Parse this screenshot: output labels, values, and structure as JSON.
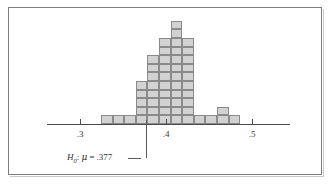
{
  "figure": {
    "border_color": "#7d7d7d",
    "background": "#ffffff"
  },
  "axis": {
    "tick_labels": [
      ".3",
      ".4",
      ".5"
    ],
    "tick_values": [
      0.3,
      0.4,
      0.5
    ],
    "line_color": "#4a4a4a"
  },
  "annotation": {
    "hypothesis_symbol": "H",
    "hypothesis_subscript": "0",
    "colon": ":",
    "mu_symbol": "μ",
    "equals": "=",
    "value": ".377",
    "full_text": "H0: μ = .377",
    "pointer_x_value": 0.377
  },
  "chart_data": {
    "type": "bar",
    "title": "",
    "subtitle": "",
    "xlabel": "",
    "ylabel": "",
    "grid": false,
    "legend": null,
    "unit": "count of observations (one square each)",
    "xlim": [
      0.272,
      0.528
    ],
    "ylim": [
      0,
      12
    ],
    "bin_width": 0.0067,
    "x": [
      0.339,
      0.346,
      0.353,
      0.359,
      0.366,
      0.373,
      0.379,
      0.386,
      0.393,
      0.4,
      0.406,
      0.413,
      0.42,
      0.426,
      0.433,
      0.44
    ],
    "categories": [
      "b1",
      "b2",
      "b3",
      "b4",
      "b5",
      "b6",
      "b7",
      "b8",
      "b9",
      "b10",
      "b11",
      "b12"
    ],
    "values": [
      1,
      1,
      1,
      5,
      8,
      10,
      12,
      10,
      1,
      1,
      2,
      1
    ],
    "bar_fill": "#d2d2d2",
    "bar_stroke": "#8a8a8a",
    "series": [
      {
        "name": "frequency",
        "values": [
          1,
          1,
          1,
          5,
          8,
          10,
          12,
          10,
          1,
          1,
          2,
          1
        ]
      }
    ],
    "annotations": [
      {
        "text": "H0: μ = .377",
        "x": 0.377,
        "type": "vertical-pointer"
      }
    ]
  }
}
